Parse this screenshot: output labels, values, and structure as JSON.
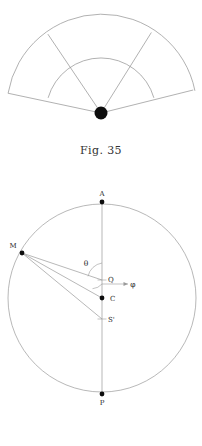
{
  "page": {
    "background_color": "#ffffff",
    "line_color": "#8d8d8d",
    "accent_color": "#000000",
    "width": 202,
    "height": 446
  },
  "figures": [
    {
      "id": "fig-35",
      "caption": "Fig. 35",
      "type": "sector-fan-diagram",
      "description": "Fan of radial lines from a filled vertex dot crossed by two concentric arcs",
      "vertex": {
        "label": "",
        "x": 101,
        "y": 113,
        "dot_radius": 6.5,
        "filled": true
      },
      "arcs": [
        {
          "name": "inner-arc",
          "radius": 55,
          "start_deg": 196,
          "end_deg": 344
        },
        {
          "name": "outer-arc",
          "radius": 95,
          "start_deg": 192,
          "end_deg": 348
        }
      ],
      "rays": [
        {
          "name": "ray-left-outer",
          "angle_deg": 192,
          "length": 95
        },
        {
          "name": "ray-left-inner",
          "angle_deg": 236,
          "length": 95
        },
        {
          "name": "ray-right-inner",
          "angle_deg": 302,
          "length": 95
        },
        {
          "name": "ray-right-outer",
          "angle_deg": 346,
          "length": 95
        }
      ]
    },
    {
      "id": "fig-36",
      "caption": "Fig. 36",
      "type": "circle-geometry-diagram",
      "description": "Circle with vertical diameter A-P, exterior-to-center point M and rays to Q, C and S'",
      "circle": {
        "cx": 102,
        "cy": 118,
        "r": 94
      },
      "points": [
        {
          "name": "point-A",
          "label": "A",
          "x": 102,
          "y": 22,
          "dot": true,
          "label_dx": 0,
          "label_dy": -5
        },
        {
          "name": "point-M",
          "label": "M",
          "x": 22,
          "y": 73,
          "dot": true,
          "label_dx": -8,
          "label_dy": -5
        },
        {
          "name": "point-Q",
          "label": "Q",
          "x": 102,
          "y": 100,
          "dot": false,
          "label_dx": 6,
          "label_dy": 1
        },
        {
          "name": "point-C",
          "label": "C",
          "x": 102,
          "y": 118,
          "dot": true,
          "label_dx": 7,
          "label_dy": 3
        },
        {
          "name": "point-S-prime",
          "label": "S'",
          "x": 102,
          "y": 139,
          "dot": false,
          "label_dx": 6,
          "label_dy": 3
        },
        {
          "name": "point-P",
          "label": "P",
          "x": 102,
          "y": 214,
          "dot": true,
          "label_dx": 0,
          "label_dy": 10
        }
      ],
      "axis": {
        "name": "vertical-diameter",
        "x": 102,
        "y1": 22,
        "y2": 214
      },
      "rays": [
        {
          "name": "ray-M-to-Q",
          "from": "M",
          "to": "Q"
        },
        {
          "name": "ray-M-to-C",
          "from": "M",
          "to": "C"
        },
        {
          "name": "ray-M-to-S-prime",
          "from": "M",
          "to": "S'"
        }
      ],
      "angles": [
        {
          "name": "angle-theta",
          "label": "θ",
          "at": "Q",
          "label_x": 86,
          "label_y": 84
        },
        {
          "name": "angle-phi",
          "label": "φ",
          "at": "C",
          "label_x": 133,
          "label_y": 104
        }
      ]
    }
  ]
}
